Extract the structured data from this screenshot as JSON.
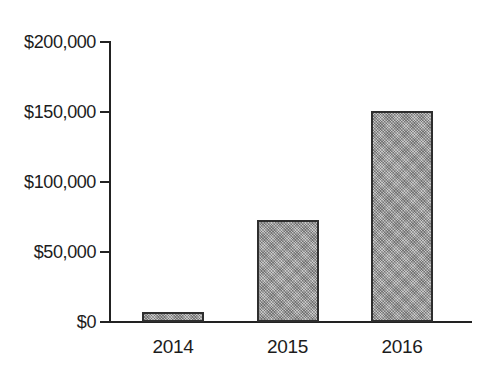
{
  "chart_data": {
    "type": "bar",
    "title": "",
    "xlabel": "",
    "ylabel": "",
    "categories": [
      "2014",
      "2015",
      "2016"
    ],
    "values": [
      7000,
      73000,
      151000
    ],
    "value_labels": [
      "$7,000",
      "$73,000",
      "$151,000"
    ],
    "ylim": [
      0,
      200000
    ],
    "y_ticks": [
      {
        "label": "$0",
        "value": 0
      },
      {
        "label": "$50,000",
        "value": 50000
      },
      {
        "label": "$100,000",
        "value": 100000
      },
      {
        "label": "$150,000",
        "value": 150000
      },
      {
        "label": "$200,000",
        "value": 200000
      }
    ],
    "grid": false,
    "legend": false,
    "colors": {
      "background": "#ffffff",
      "axis": "#222222",
      "text": "#1c1c1c",
      "bar_fill": "#b3b3b3",
      "bar_border": "#2e2e2e"
    }
  }
}
